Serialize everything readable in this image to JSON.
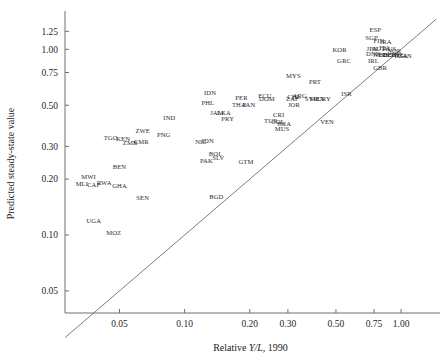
{
  "chart_data": {
    "type": "scatter",
    "title": "",
    "xlabel": "Relative Y/L, 1990",
    "xlabel_parts": {
      "pre": "Relative ",
      "italic": "Y/L",
      "post": ", 1990"
    },
    "ylabel": "Predicted steady-state value",
    "xscale": "log",
    "yscale": "log",
    "xlim": [
      0.028,
      1.45
    ],
    "ylim": [
      0.038,
      1.55
    ],
    "grid": false,
    "legend": null,
    "xticks": [
      0.05,
      0.1,
      0.2,
      0.3,
      0.5,
      0.75,
      1.0
    ],
    "xticklabels": [
      "0.05",
      "0.10",
      "0.20",
      "0.30",
      "0.50",
      "0.75",
      "1.00"
    ],
    "yticks": [
      0.05,
      0.1,
      0.2,
      0.3,
      0.5,
      0.75,
      1.0,
      1.25
    ],
    "yticklabels": [
      "0.05",
      "0.10",
      "0.20",
      "0.30",
      "0.50",
      "0.75",
      "1.00",
      "1.25"
    ],
    "reference_line": {
      "type": "45-degree identity",
      "from": [
        0.028,
        0.028
      ],
      "to": [
        1.45,
        1.45
      ]
    },
    "marker_style": "country-code-text",
    "points": [
      {
        "label": "UGA",
        "x": 0.038,
        "y": 0.118
      },
      {
        "label": "MOZ",
        "x": 0.047,
        "y": 0.102
      },
      {
        "label": "MWI",
        "x": 0.036,
        "y": 0.205
      },
      {
        "label": "MLI",
        "x": 0.0335,
        "y": 0.187
      },
      {
        "label": "CAF",
        "x": 0.038,
        "y": 0.185
      },
      {
        "label": "RWA",
        "x": 0.0425,
        "y": 0.19
      },
      {
        "label": "GHA",
        "x": 0.05,
        "y": 0.182
      },
      {
        "label": "BEN",
        "x": 0.05,
        "y": 0.232
      },
      {
        "label": "SEN",
        "x": 0.064,
        "y": 0.157
      },
      {
        "label": "TGO",
        "x": 0.0455,
        "y": 0.33
      },
      {
        "label": "KEN",
        "x": 0.052,
        "y": 0.325
      },
      {
        "label": "ZMB",
        "x": 0.056,
        "y": 0.31
      },
      {
        "label": "CMR",
        "x": 0.063,
        "y": 0.315
      },
      {
        "label": "ZWE",
        "x": 0.064,
        "y": 0.36
      },
      {
        "label": "PNG",
        "x": 0.08,
        "y": 0.345
      },
      {
        "label": "IND",
        "x": 0.085,
        "y": 0.425
      },
      {
        "label": "NIC",
        "x": 0.119,
        "y": 0.315
      },
      {
        "label": "IDN",
        "x": 0.128,
        "y": 0.318
      },
      {
        "label": "PAK",
        "x": 0.126,
        "y": 0.25
      },
      {
        "label": "BOL",
        "x": 0.139,
        "y": 0.272
      },
      {
        "label": "SLV",
        "x": 0.143,
        "y": 0.258
      },
      {
        "label": "BGD",
        "x": 0.14,
        "y": 0.16
      },
      {
        "label": "IDN2",
        "display": "IDN",
        "x": 0.131,
        "y": 0.575
      },
      {
        "label": "PHL",
        "x": 0.128,
        "y": 0.51
      },
      {
        "label": "JAM",
        "x": 0.141,
        "y": 0.45
      },
      {
        "label": "LKA",
        "x": 0.152,
        "y": 0.45
      },
      {
        "label": "PRY",
        "x": 0.158,
        "y": 0.418
      },
      {
        "label": "THA",
        "x": 0.178,
        "y": 0.5
      },
      {
        "label": "PER",
        "x": 0.183,
        "y": 0.545
      },
      {
        "label": "PAN",
        "x": 0.198,
        "y": 0.498
      },
      {
        "label": "GTM",
        "x": 0.192,
        "y": 0.245
      },
      {
        "label": "ECU",
        "x": 0.235,
        "y": 0.56
      },
      {
        "label": "DOM",
        "x": 0.24,
        "y": 0.54
      },
      {
        "label": "TUR",
        "x": 0.25,
        "y": 0.408
      },
      {
        "label": "CRI",
        "x": 0.272,
        "y": 0.44
      },
      {
        "label": "COL",
        "x": 0.27,
        "y": 0.405
      },
      {
        "label": "BRA",
        "x": 0.288,
        "y": 0.395
      },
      {
        "label": "MUS",
        "x": 0.282,
        "y": 0.368
      },
      {
        "label": "CHL",
        "x": 0.32,
        "y": 0.552
      },
      {
        "label": "ARG",
        "x": 0.34,
        "y": 0.56
      },
      {
        "label": "ZAF",
        "x": 0.315,
        "y": 0.54
      },
      {
        "label": "JOR",
        "x": 0.32,
        "y": 0.5
      },
      {
        "label": "SYR",
        "x": 0.385,
        "y": 0.54
      },
      {
        "label": "MEX",
        "x": 0.41,
        "y": 0.538
      },
      {
        "label": "URY",
        "x": 0.44,
        "y": 0.54
      },
      {
        "label": "VEN",
        "x": 0.455,
        "y": 0.405
      },
      {
        "label": "MYS",
        "x": 0.318,
        "y": 0.715
      },
      {
        "label": "PRT",
        "x": 0.4,
        "y": 0.66
      },
      {
        "label": "ISR",
        "x": 0.56,
        "y": 0.57
      },
      {
        "label": "KOR",
        "x": 0.52,
        "y": 0.98
      },
      {
        "label": "GRC",
        "x": 0.545,
        "y": 0.855
      },
      {
        "label": "ESP",
        "x": 0.76,
        "y": 1.265
      },
      {
        "label": "SGP",
        "x": 0.73,
        "y": 1.145
      },
      {
        "label": "FIN",
        "x": 0.79,
        "y": 1.105
      },
      {
        "label": "IRA",
        "x": 0.85,
        "y": 1.085
      },
      {
        "label": "JPN",
        "x": 0.735,
        "y": 1.0
      },
      {
        "label": "AUT",
        "x": 0.785,
        "y": 1.0
      },
      {
        "label": "ITA",
        "x": 0.84,
        "y": 1.005
      },
      {
        "label": "AUS",
        "x": 0.885,
        "y": 0.995
      },
      {
        "label": "NOR",
        "x": 0.93,
        "y": 0.975
      },
      {
        "label": "IRL",
        "x": 0.745,
        "y": 0.855
      },
      {
        "label": "GBR",
        "x": 0.8,
        "y": 0.79
      },
      {
        "label": "DNK",
        "x": 0.745,
        "y": 0.935
      },
      {
        "label": "NLD",
        "x": 0.8,
        "y": 0.93
      },
      {
        "label": "BEL",
        "x": 0.845,
        "y": 0.93
      },
      {
        "label": "DEU",
        "x": 0.885,
        "y": 0.93
      },
      {
        "label": "CHE",
        "x": 0.925,
        "y": 0.93
      },
      {
        "label": "SWE",
        "x": 0.955,
        "y": 0.925
      },
      {
        "label": "USA",
        "x": 1.0,
        "y": 0.92
      },
      {
        "label": "CAN",
        "x": 1.04,
        "y": 0.915
      }
    ]
  }
}
